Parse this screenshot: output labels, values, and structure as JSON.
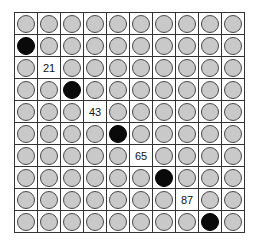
{
  "grid": {
    "rows": 10,
    "cols": 10,
    "colors": {
      "gray_dot": "#c9c9c9",
      "black_dot": "#0a0a0a",
      "line": "#333333"
    },
    "cells": [
      [
        "gray",
        "gray",
        "gray",
        "gray",
        "gray",
        "gray",
        "gray",
        "gray",
        "gray",
        "gray"
      ],
      [
        "black",
        "gray",
        "gray",
        "gray",
        "gray",
        "gray",
        "gray",
        "gray",
        "gray",
        "gray"
      ],
      [
        "gray",
        "21",
        "gray",
        "gray",
        "gray",
        "gray",
        "gray",
        "gray",
        "gray",
        "gray"
      ],
      [
        "gray",
        "gray",
        "black",
        "gray",
        "gray",
        "gray",
        "gray",
        "gray",
        "gray",
        "gray"
      ],
      [
        "gray",
        "gray",
        "gray",
        "43",
        "gray",
        "gray",
        "gray",
        "gray",
        "gray",
        "gray"
      ],
      [
        "gray",
        "gray",
        "gray",
        "gray",
        "black",
        "gray",
        "gray",
        "gray",
        "gray",
        "gray"
      ],
      [
        "gray",
        "gray",
        "gray",
        "gray",
        "gray",
        "65",
        "gray",
        "gray",
        "gray",
        "gray"
      ],
      [
        "gray",
        "gray",
        "gray",
        "gray",
        "gray",
        "gray",
        "black",
        "gray",
        "gray",
        "gray"
      ],
      [
        "gray",
        "gray",
        "gray",
        "gray",
        "gray",
        "gray",
        "gray",
        "87",
        "gray",
        "gray"
      ],
      [
        "gray",
        "gray",
        "gray",
        "gray",
        "gray",
        "gray",
        "gray",
        "gray",
        "black",
        "gray"
      ]
    ],
    "labels": [
      {
        "row": 2,
        "col": 1,
        "text": "21"
      },
      {
        "row": 4,
        "col": 3,
        "text": "43"
      },
      {
        "row": 6,
        "col": 5,
        "text": "65"
      },
      {
        "row": 8,
        "col": 7,
        "text": "87"
      }
    ]
  }
}
